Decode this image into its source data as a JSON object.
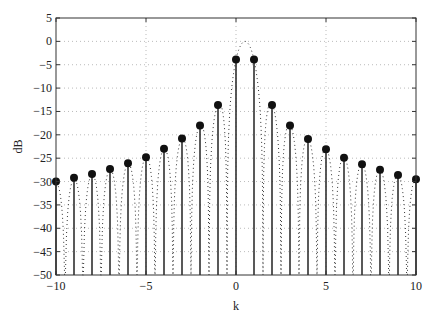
{
  "chart_data": {
    "type": "stem",
    "title": "",
    "xlabel": "k",
    "ylabel": "dB",
    "xlim": [
      -10,
      10
    ],
    "ylim": [
      -50,
      5
    ],
    "grid": true,
    "grid_style": "dotted",
    "legend": null,
    "x_ticks": [
      -10,
      -5,
      0,
      5,
      10
    ],
    "y_ticks": [
      5,
      0,
      -5,
      -10,
      -15,
      -20,
      -25,
      -30,
      -35,
      -40,
      -45,
      -50
    ],
    "x_tick_labels": [
      "−10",
      "−5",
      "0",
      "5",
      "10"
    ],
    "y_tick_labels": [
      "5",
      "0",
      "−5",
      "−10",
      "−15",
      "−20",
      "−25",
      "−30",
      "−35",
      "−40",
      "−45",
      "−50"
    ],
    "series": [
      {
        "name": "stems",
        "style": "stem with filled circle markers",
        "x": [
          -10,
          -9,
          -8,
          -7,
          -6,
          -5,
          -4,
          -3,
          -2,
          -1,
          0,
          1,
          2,
          3,
          4,
          5,
          6,
          7,
          8,
          9,
          10
        ],
        "values": [
          -30.0,
          -29.2,
          -28.4,
          -27.3,
          -26.1,
          -24.8,
          -23.0,
          -20.8,
          -18.0,
          -13.6,
          -3.9,
          -3.9,
          -13.6,
          -18.0,
          -20.9,
          -23.1,
          -24.9,
          -26.3,
          -27.5,
          -28.6,
          -29.5
        ]
      },
      {
        "name": "continuous response",
        "style": "dotted line",
        "description": "sinc-like dB envelope peaking near 0 dB at k=0.5 with nulls between integer k, clipped at -50 dB"
      }
    ],
    "colors": {
      "stem": "#222222",
      "marker": "#111111",
      "curve": "#333333",
      "grid": "#bbbbbb",
      "axes": "#333333"
    }
  }
}
